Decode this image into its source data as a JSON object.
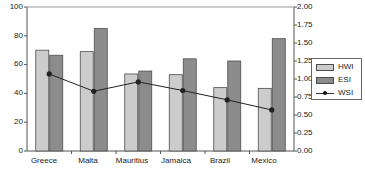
{
  "chart_data": {
    "type": "bar",
    "title": "",
    "subtitle": "",
    "xlabel": "",
    "ylabel": "",
    "y2label": "",
    "categories": [
      "Greece",
      "Malta",
      "Mauritius",
      "Jamaica",
      "Brazil",
      "Mexico"
    ],
    "series": [
      {
        "name": "HWI",
        "type": "bar",
        "axis": "left",
        "color": "#cccccc",
        "values": [
          70,
          69,
          53.5,
          53,
          44,
          43.5
        ]
      },
      {
        "name": "ESI",
        "type": "bar",
        "axis": "left",
        "color": "#8c8c8c",
        "values": [
          66.5,
          85,
          55.5,
          64,
          62.5,
          78
        ]
      },
      {
        "name": "WSI",
        "type": "line",
        "axis": "right",
        "color": "#222222",
        "marker": "circle",
        "values": [
          1.07,
          0.83,
          0.96,
          0.84,
          0.71,
          0.57
        ]
      }
    ],
    "ylim": [
      0,
      100
    ],
    "yticks": [
      0,
      20,
      40,
      60,
      80,
      100
    ],
    "ytick_labels": [
      "0",
      "20",
      "40",
      "60",
      "80",
      "100"
    ],
    "y2lim": [
      0,
      2.0
    ],
    "y2ticks": [
      0.0,
      0.25,
      0.5,
      0.75,
      1.0,
      1.25,
      1.5,
      1.75,
      2.0
    ],
    "y2tick_labels": [
      "0.00",
      "0.25",
      "0.50",
      "0.75",
      "1.00",
      "1.25",
      "1.50",
      "1.75",
      "2.00"
    ],
    "grid": false,
    "legend": {
      "position": "right",
      "entries": [
        "HWI",
        "ESI",
        "WSI"
      ]
    }
  }
}
